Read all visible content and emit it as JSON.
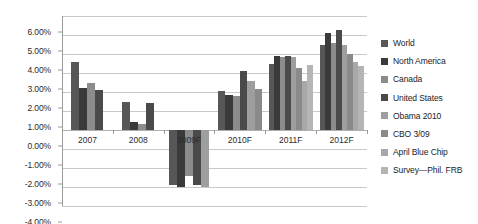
{
  "chart_data": {
    "type": "bar",
    "title": "",
    "subtitle": "",
    "xlabel": "",
    "ylabel": "",
    "categories": [
      "2007",
      "2008",
      "2009F",
      "2010F",
      "2011F",
      "2012F"
    ],
    "ylim": [
      -4.0,
      6.0
    ],
    "ytick_labels": [
      "6.00%",
      "5.00%",
      "4.00%",
      "3.00%",
      "2.00%",
      "1.00%",
      "0.00%",
      "-1.00%",
      "-2.00%",
      "-3.00%",
      "-4.00%"
    ],
    "ytick_values": [
      6,
      5,
      4,
      3,
      2,
      1,
      0,
      -1,
      -2,
      -3,
      -4
    ],
    "grid": true,
    "legend_position": "right",
    "units": "percent",
    "series": [
      {
        "name": "World",
        "color": "#575757",
        "values": [
          3.6,
          1.5,
          -2.9,
          2.05,
          3.5,
          4.5
        ]
      },
      {
        "name": "North America",
        "color": "#3a3a3a",
        "values": [
          2.2,
          0.4,
          -3.0,
          1.85,
          3.9,
          5.1
        ]
      },
      {
        "name": "Canada",
        "color": "#8c8c8c",
        "values": [
          2.45,
          0.3,
          -2.4,
          1.8,
          3.85,
          4.6
        ]
      },
      {
        "name": "United States",
        "color": "#4a4a4a",
        "values": [
          2.1,
          1.4,
          -2.9,
          3.1,
          3.9,
          5.25
        ]
      },
      {
        "name": "Obama 2010",
        "color": "#9e9e9e",
        "values": [
          null,
          null,
          -3.0,
          2.6,
          3.85,
          4.5
        ]
      },
      {
        "name": "CBO 3/09",
        "color": "#8a8a8a",
        "values": [
          null,
          null,
          null,
          2.15,
          3.25,
          4.0
        ]
      },
      {
        "name": "April Blue Chip",
        "color": "#a8a8a8",
        "values": [
          null,
          null,
          null,
          null,
          2.6,
          3.6
        ]
      },
      {
        "name": "Survey—Phil. FRB",
        "color": "#b5b5b5",
        "values": [
          null,
          null,
          null,
          null,
          3.4,
          3.35
        ]
      }
    ]
  },
  "legend": {
    "items": [
      {
        "label": "World"
      },
      {
        "label": "North America"
      },
      {
        "label": "Canada"
      },
      {
        "label": "United States"
      },
      {
        "label": "Obama 2010"
      },
      {
        "label": "CBO 3/09"
      },
      {
        "label": "April Blue Chip"
      },
      {
        "label": "Survey—Phil. FRB"
      }
    ]
  }
}
